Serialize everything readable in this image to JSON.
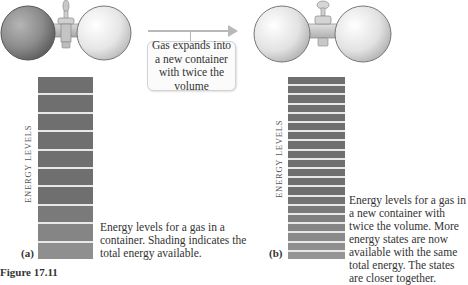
{
  "figure": {
    "callout_text": "Gas expands into a new container with twice the volume",
    "panel_a": {
      "label": "(a)",
      "axis_label": "ENERGY LEVELS",
      "caption": "Energy levels for a gas in a container. Shading indicates the total energy available.",
      "band_count": 10
    },
    "panel_b": {
      "label": "(b)",
      "axis_label": "ENERGY LEVELS",
      "caption": "Energy levels for a gas in a new container with twice the volume. More energy states are now available with the same total energy. The states are closer together.",
      "band_count": 20
    },
    "figure_caption": "Figure 17.11"
  },
  "colors": {
    "band_dark": "#6f6f6f",
    "band_light": "#9a9a9a",
    "band_gap": "#e8e8e8",
    "arrow": "#b8b8b8"
  }
}
